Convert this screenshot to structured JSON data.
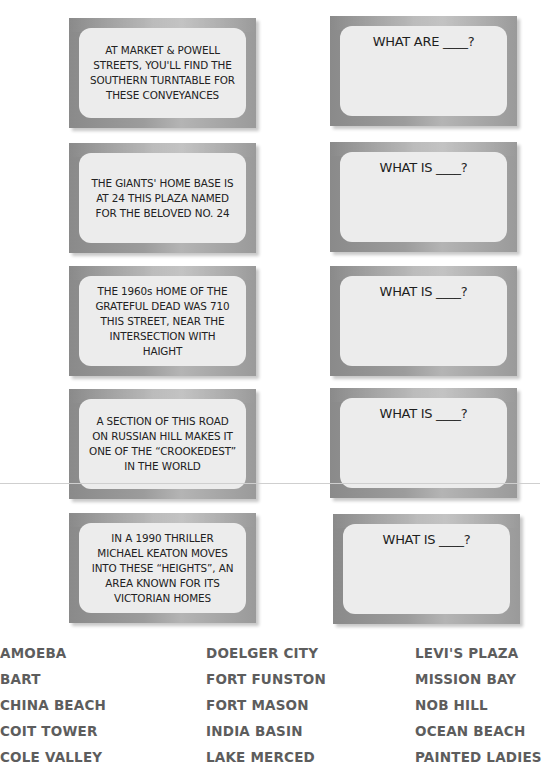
{
  "clues": [
    {
      "text": "AT MARKET & POWELL STREETS, YOU'LL FIND THE SOUTHERN TURNTABLE FOR THESE CONVEYANCES"
    },
    {
      "text": "THE GIANTS' HOME BASE IS AT 24 THIS PLAZA NAMED FOR THE BELOVED NO. 24"
    },
    {
      "text": "THE 1960s HOME OF THE GRATEFUL DEAD WAS 710 THIS STREET, NEAR THE INTERSECTION WITH HAIGHT"
    },
    {
      "text": "A SECTION OF THIS ROAD ON RUSSIAN HILL MAKES IT ONE OF THE “CROOKEDEST” IN THE WORLD"
    },
    {
      "text": "IN A 1990 THRILLER MICHAEL KEATON MOVES INTO THESE “HEIGHTS”, AN AREA KNOWN FOR ITS VICTORIAN HOMES"
    }
  ],
  "answers": [
    {
      "prompt": "WHAT ARE ____?"
    },
    {
      "prompt": "WHAT IS ____?"
    },
    {
      "prompt": "WHAT IS ____?"
    },
    {
      "prompt": "WHAT IS ____?"
    },
    {
      "prompt": "WHAT IS ____?"
    }
  ],
  "word_bank": {
    "columns": [
      [
        "AMOEBA",
        "BART",
        "CHINA BEACH",
        "COIT TOWER",
        "COLE VALLEY"
      ],
      [
        "DOELGER CITY",
        "FORT FUNSTON",
        "FORT MASON",
        "INDIA BASIN",
        "LAKE MERCED"
      ],
      [
        "LEVI'S PLAZA",
        "MISSION BAY",
        "NOB HILL",
        "OCEAN BEACH",
        "PAINTED LADIES"
      ]
    ]
  },
  "colors": {
    "card_frame": "#9c9c9c",
    "card_panel": "#ececec",
    "text": "#222222",
    "word_bank_text": "#5d5d5d"
  }
}
